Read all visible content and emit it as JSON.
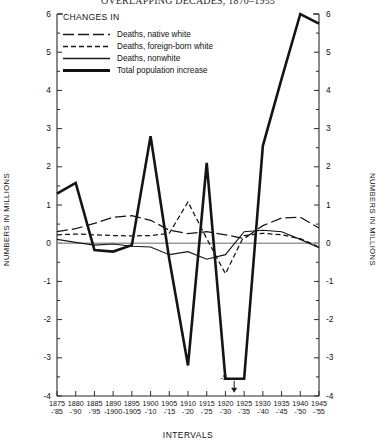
{
  "title": "OVERLAPPING DECADES, 1870–1955",
  "axes": {
    "y_label_left": "NUMBERS IN MILLIONS",
    "y_label_right": "NUMBERS IN MILLIONS",
    "x_label": "INTERVALS",
    "y_ticks": [
      6,
      5,
      4,
      3,
      2,
      1,
      0,
      -1,
      -2,
      -3,
      -4
    ],
    "y_tick_labels": [
      "6",
      "5",
      "4",
      "3",
      "2",
      "1",
      "0",
      "-1",
      "-2",
      "-3",
      "-4"
    ]
  },
  "legend": {
    "title": "CHANGES IN",
    "items": [
      {
        "label": "Deaths, native white",
        "style": "dash-dot",
        "width": 1.1
      },
      {
        "label": "Deaths, foreign-born white",
        "style": "dashed",
        "width": 1.1
      },
      {
        "label": "Deaths, nonwhite",
        "style": "solid",
        "width": 1.0
      },
      {
        "label": "Total population increase",
        "style": "solid",
        "width": 2.3
      }
    ]
  },
  "annotations": [
    {
      "text": "-5",
      "x_value": 1925,
      "y_value": -3.55,
      "arrow": "down",
      "note": "off-scale value marker for total population increase"
    }
  ],
  "chart_data": {
    "type": "line",
    "title": "OVERLAPPING DECADES, 1870–1955",
    "xlabel": "INTERVALS",
    "ylabel": "NUMBERS IN MILLIONS",
    "xlim": [
      1875,
      1945
    ],
    "ylim": [
      -4,
      6
    ],
    "grid": false,
    "legend_position": "top-left",
    "x": [
      1875,
      1880,
      1885,
      1890,
      1895,
      1900,
      1905,
      1910,
      1915,
      1920,
      1925,
      1930,
      1935,
      1940,
      1945
    ],
    "x_tick_labels_line1": [
      "1875",
      "1880",
      "1885",
      "1890",
      "1895",
      "1900",
      "1905",
      "1910",
      "1915",
      "1920",
      "1925",
      "1930",
      "1935",
      "1940",
      "1945"
    ],
    "x_tick_labels_line2": [
      "-'85",
      "-'90",
      "-'95",
      "-1900",
      "-1905",
      "-'10",
      "-'15",
      "-'20",
      "-'25",
      "-'30",
      "-'35",
      "-'40",
      "-'45",
      "-'50",
      "-'55"
    ],
    "series": [
      {
        "name": "Deaths, native white",
        "style": "dash-dot",
        "values": [
          0.3,
          0.38,
          0.52,
          0.68,
          0.72,
          0.6,
          0.34,
          0.25,
          0.3,
          0.22,
          0.12,
          0.46,
          0.66,
          0.68,
          0.4
        ]
      },
      {
        "name": "Deaths, foreign-born white",
        "style": "dashed",
        "values": [
          0.22,
          0.24,
          0.22,
          0.2,
          0.19,
          0.2,
          0.26,
          1.08,
          0.12,
          -0.8,
          0.2,
          0.26,
          0.22,
          0.12,
          -0.1
        ]
      },
      {
        "name": "Deaths, nonwhite",
        "style": "solid-thin",
        "values": [
          0.1,
          0.02,
          -0.05,
          -0.02,
          -0.08,
          -0.1,
          -0.3,
          -0.22,
          -0.42,
          -0.3,
          0.3,
          0.34,
          0.3,
          0.1,
          -0.12
        ]
      },
      {
        "name": "Total population increase",
        "style": "solid-thick",
        "values": [
          1.3,
          1.58,
          -0.18,
          -0.22,
          -0.05,
          2.8,
          -0.42,
          -3.2,
          2.1,
          -3.55,
          -3.55,
          2.55,
          4.3,
          6.0,
          5.75
        ],
        "offscale_note": "values at 1920 and 1925 run below the -4 axis limit; marked -5"
      }
    ]
  }
}
